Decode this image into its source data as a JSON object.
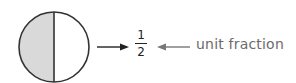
{
  "diagram": {
    "shape": "circle",
    "parts": 2,
    "shaded_parts": 1,
    "shade_color": "#d9d9d9",
    "fraction": {
      "numerator": "1",
      "denominator": "2"
    },
    "label": "unit fraction",
    "label_color": "#6b6b6b"
  }
}
